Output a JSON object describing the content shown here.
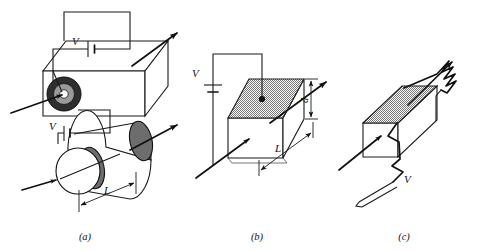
{
  "figure": {
    "title": "",
    "background_color": "#ffffff",
    "ink_color": "#1a1a1a",
    "shade_color": "#808080",
    "panels": [
      {
        "id": "a",
        "caption": "(a)",
        "caption_x": 85,
        "caption_y": 240,
        "description": "Coaxial cable shown as rectangular block with annular cross-section, and a cylinder below",
        "labels": {
          "voltage_top": "V",
          "voltage_lower": "V",
          "length": "L"
        },
        "icons": [
          "battery-symbol",
          "current-arrow",
          "annulus-cross-section",
          "cylinder-shape",
          "length-dimension"
        ]
      },
      {
        "id": "b",
        "caption": "(b)",
        "caption_x": 257,
        "caption_y": 240,
        "description": "Rectangular slab with shaded top face, battery connected to top, thickness d and length L",
        "labels": {
          "voltage": "V",
          "thickness": "d",
          "length": "L"
        },
        "icons": [
          "battery-symbol",
          "current-arrow",
          "shaded-top-face",
          "thickness-dimension",
          "length-dimension",
          "contact-dot"
        ]
      },
      {
        "id": "c",
        "caption": "(c)",
        "caption_x": 404,
        "caption_y": 240,
        "description": "Rectangular slab with shaded top face, zigzag resistor lead at upper right and zigzag probe lead labeled V at lower left",
        "labels": {
          "voltage": "V"
        },
        "icons": [
          "resistor-zigzag",
          "current-arrow",
          "shaded-top-face",
          "probe-lead"
        ]
      }
    ]
  }
}
